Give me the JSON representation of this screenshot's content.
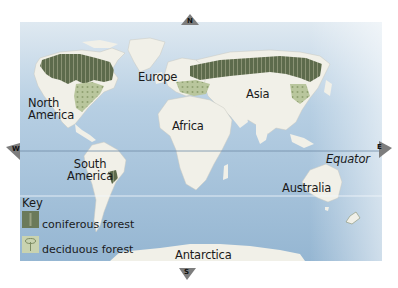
{
  "map": {
    "title": "World forest map",
    "colors": {
      "ocean": "#9fbfd8",
      "ocean_light": "#c6dbea",
      "land": "#f1f0e8",
      "coniferous": "#5f6e4f",
      "deciduous": "#b9c79e",
      "equator_line": "#6f8aa6"
    },
    "compass": {
      "north": "N",
      "south": "S",
      "east": "E",
      "west": "W"
    },
    "labels": {
      "north_america": "North\nAmerica",
      "north_america_line1": "North",
      "north_america_line2": "America",
      "south_america_line1": "South",
      "south_america_line2": "America",
      "europe": "Europe",
      "asia": "Asia",
      "africa": "Africa",
      "australia": "Australia",
      "antarctica": "Antarctica",
      "equator": "Equator"
    },
    "key": {
      "title": "Key",
      "items": [
        {
          "label": "coniferous forest",
          "icon": "conifer-tree-icon"
        },
        {
          "label": "deciduous forest",
          "icon": "deciduous-tree-icon"
        }
      ]
    }
  }
}
